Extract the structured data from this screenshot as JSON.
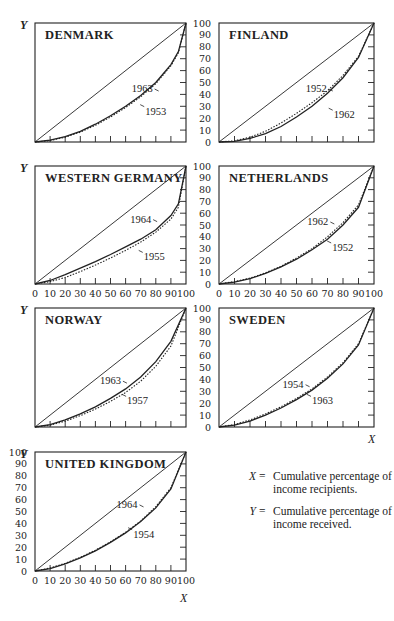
{
  "chart_data": [
    {
      "type": "line",
      "title": "DENMARK",
      "xlabel": "",
      "ylabel": "Y",
      "xlim": [
        0,
        100
      ],
      "ylim": [
        0,
        100
      ],
      "show_x_ticklabels": false,
      "show_y_ticklabels": false,
      "series": [
        {
          "name": "Equality line",
          "style": "solid-thin",
          "x": [
            0,
            100
          ],
          "y": [
            0,
            100
          ]
        },
        {
          "name": "1963",
          "style": "solid",
          "x": [
            0,
            10,
            20,
            30,
            40,
            50,
            60,
            70,
            80,
            90,
            95,
            100
          ],
          "y": [
            0,
            1.5,
            4.5,
            9,
            15,
            22,
            30,
            39,
            50,
            65,
            76,
            100
          ]
        },
        {
          "name": "1953",
          "style": "dotted",
          "x": [
            0,
            10,
            20,
            30,
            40,
            50,
            60,
            70,
            80,
            90,
            95,
            100
          ],
          "y": [
            0,
            1.2,
            4,
            8.3,
            14,
            21,
            29,
            38,
            49,
            64,
            75,
            100
          ]
        }
      ],
      "annotations": [
        {
          "text": "1963",
          "x": 64,
          "y": 42
        },
        {
          "text": "1953",
          "x": 73,
          "y": 23
        }
      ]
    },
    {
      "type": "line",
      "title": "FINLAND",
      "xlabel": "",
      "ylabel": "",
      "xlim": [
        0,
        100
      ],
      "ylim": [
        0,
        100
      ],
      "show_x_ticklabels": false,
      "show_y_ticklabels": true,
      "series": [
        {
          "name": "Equality line",
          "style": "solid-thin",
          "x": [
            0,
            100
          ],
          "y": [
            0,
            100
          ]
        },
        {
          "name": "1952",
          "style": "dotted",
          "x": [
            0,
            10,
            20,
            30,
            40,
            50,
            60,
            70,
            80,
            90,
            100
          ],
          "y": [
            0,
            1,
            4,
            9,
            16,
            24,
            33,
            43,
            56,
            72,
            100
          ]
        },
        {
          "name": "1962",
          "style": "solid",
          "x": [
            0,
            10,
            20,
            30,
            40,
            50,
            60,
            70,
            80,
            90,
            100
          ],
          "y": [
            0,
            0.5,
            3,
            7,
            13,
            21,
            30,
            41,
            54,
            71,
            100
          ]
        }
      ],
      "annotations": [
        {
          "text": "1952",
          "x": 56,
          "y": 42
        },
        {
          "text": "1962",
          "x": 74,
          "y": 20
        }
      ]
    },
    {
      "type": "line",
      "title": "WESTERN GERMANY",
      "xlabel": "",
      "ylabel": "Y",
      "xlim": [
        0,
        100
      ],
      "ylim": [
        0,
        100
      ],
      "show_x_ticklabels": true,
      "show_y_ticklabels": false,
      "series": [
        {
          "name": "Equality line",
          "style": "solid-thin",
          "x": [
            0,
            100
          ],
          "y": [
            0,
            100
          ]
        },
        {
          "name": "1964",
          "style": "solid",
          "x": [
            0,
            10,
            20,
            30,
            40,
            50,
            60,
            70,
            80,
            90,
            95,
            100
          ],
          "y": [
            0,
            3,
            8,
            13.5,
            19,
            25,
            31.5,
            38,
            46,
            58,
            68,
            100
          ]
        },
        {
          "name": "1955",
          "style": "dotted",
          "x": [
            0,
            10,
            20,
            30,
            40,
            50,
            60,
            70,
            80,
            90,
            95,
            100
          ],
          "y": [
            0,
            2,
            5.5,
            10.5,
            16,
            22,
            28.5,
            35.5,
            44,
            55,
            65,
            100
          ]
        }
      ],
      "annotations": [
        {
          "text": "1964",
          "x": 63,
          "y": 52
        },
        {
          "text": "1955",
          "x": 72,
          "y": 20
        }
      ]
    },
    {
      "type": "line",
      "title": "NETHERLANDS",
      "xlabel": "",
      "ylabel": "",
      "xlim": [
        0,
        100
      ],
      "ylim": [
        0,
        100
      ],
      "show_x_ticklabels": true,
      "show_y_ticklabels": true,
      "series": [
        {
          "name": "Equality line",
          "style": "solid-thin",
          "x": [
            0,
            100
          ],
          "y": [
            0,
            100
          ]
        },
        {
          "name": "1962",
          "style": "dotted",
          "x": [
            0,
            10,
            20,
            30,
            40,
            50,
            60,
            70,
            80,
            90,
            100
          ],
          "y": [
            0,
            2,
            5,
            9.5,
            15,
            22,
            30,
            40,
            52,
            67,
            100
          ]
        },
        {
          "name": "1952",
          "style": "solid",
          "x": [
            0,
            10,
            20,
            30,
            40,
            50,
            60,
            70,
            80,
            90,
            100
          ],
          "y": [
            0,
            1.5,
            4.5,
            9,
            14.5,
            21,
            29,
            38,
            50,
            65,
            100
          ]
        }
      ],
      "annotations": [
        {
          "text": "1962",
          "x": 57,
          "y": 50
        },
        {
          "text": "1952",
          "x": 73,
          "y": 28
        }
      ]
    },
    {
      "type": "line",
      "title": "NORWAY",
      "xlabel": "",
      "ylabel": "Y",
      "xlim": [
        0,
        100
      ],
      "ylim": [
        0,
        100
      ],
      "show_x_ticklabels": false,
      "show_y_ticklabels": false,
      "series": [
        {
          "name": "Equality line",
          "style": "solid-thin",
          "x": [
            0,
            100
          ],
          "y": [
            0,
            100
          ]
        },
        {
          "name": "1963",
          "style": "solid",
          "x": [
            0,
            10,
            20,
            30,
            40,
            50,
            60,
            70,
            80,
            90,
            100
          ],
          "y": [
            0,
            2,
            6,
            11,
            17,
            24,
            32,
            42,
            55,
            72,
            100
          ]
        },
        {
          "name": "1957",
          "style": "dotted",
          "x": [
            0,
            10,
            20,
            30,
            40,
            50,
            60,
            70,
            80,
            90,
            100
          ],
          "y": [
            0,
            1.5,
            5,
            9.5,
            15,
            21.5,
            29,
            38.5,
            51,
            68,
            100
          ]
        }
      ],
      "annotations": [
        {
          "text": "1963",
          "x": 43,
          "y": 36
        },
        {
          "text": "1957",
          "x": 61,
          "y": 19
        }
      ]
    },
    {
      "type": "line",
      "title": "SWEDEN",
      "xlabel": "X",
      "ylabel": "",
      "xlim": [
        0,
        100
      ],
      "ylim": [
        0,
        100
      ],
      "show_x_ticklabels": false,
      "show_y_ticklabels": true,
      "series": [
        {
          "name": "Equality line",
          "style": "solid-thin",
          "x": [
            0,
            100
          ],
          "y": [
            0,
            100
          ]
        },
        {
          "name": "1954",
          "style": "dotted",
          "x": [
            0,
            10,
            20,
            30,
            40,
            50,
            60,
            70,
            80,
            90,
            100
          ],
          "y": [
            0,
            2,
            6,
            11,
            17,
            24,
            32,
            42,
            54,
            70,
            100
          ]
        },
        {
          "name": "1963",
          "style": "solid",
          "x": [
            0,
            10,
            20,
            30,
            40,
            50,
            60,
            70,
            80,
            90,
            100
          ],
          "y": [
            0,
            1.5,
            5,
            10,
            16,
            23,
            31,
            41,
            53,
            69,
            100
          ]
        }
      ],
      "annotations": [
        {
          "text": "1954",
          "x": 41,
          "y": 33
        },
        {
          "text": "1963",
          "x": 60,
          "y": 19
        }
      ]
    },
    {
      "type": "line",
      "title": "UNITED KINGDOM",
      "xlabel": "X",
      "ylabel": "Y",
      "xlim": [
        0,
        100
      ],
      "ylim": [
        0,
        100
      ],
      "show_x_ticklabels": true,
      "show_y_ticklabels": true,
      "series": [
        {
          "name": "Equality line",
          "style": "solid-thin",
          "x": [
            0,
            100
          ],
          "y": [
            0,
            100
          ]
        },
        {
          "name": "1964",
          "style": "dotted",
          "x": [
            0,
            10,
            20,
            30,
            40,
            50,
            60,
            70,
            80,
            90,
            100
          ],
          "y": [
            0,
            2.5,
            6.5,
            11.5,
            17.5,
            24.5,
            32.5,
            42,
            54,
            70,
            100
          ]
        },
        {
          "name": "1954",
          "style": "solid",
          "x": [
            0,
            10,
            20,
            30,
            40,
            50,
            60,
            70,
            80,
            90,
            100
          ],
          "y": [
            0,
            2,
            6,
            11,
            17,
            24,
            32,
            41.5,
            53,
            69,
            100
          ]
        }
      ],
      "annotations": [
        {
          "text": "1964",
          "x": 54,
          "y": 53
        },
        {
          "text": "1954",
          "x": 65,
          "y": 28
        }
      ]
    }
  ],
  "layout": {
    "panels": [
      {
        "x0": 35,
        "y0": 23,
        "x1": 186,
        "y1": 142
      },
      {
        "x0": 219,
        "y0": 23,
        "x1": 374,
        "y1": 142
      },
      {
        "x0": 35,
        "y0": 166,
        "x1": 186,
        "y1": 284
      },
      {
        "x0": 219,
        "y0": 166,
        "x1": 374,
        "y1": 284
      },
      {
        "x0": 35,
        "y0": 308,
        "x1": 186,
        "y1": 427
      },
      {
        "x0": 219,
        "y0": 308,
        "x1": 374,
        "y1": 427
      },
      {
        "x0": 35,
        "y0": 452,
        "x1": 186,
        "y1": 571
      }
    ],
    "tick_values": [
      0,
      10,
      20,
      30,
      40,
      50,
      60,
      70,
      80,
      90,
      100
    ]
  },
  "legend": {
    "items": [
      {
        "symbol": "X",
        "equals": "=",
        "text": "Cumulative percentage of income recipients."
      },
      {
        "symbol": "Y",
        "equals": "=",
        "text": "Cumulative percentage of income received."
      }
    ]
  }
}
